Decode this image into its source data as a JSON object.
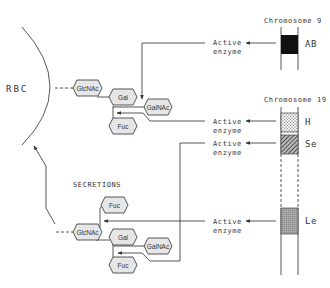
{
  "diagram": {
    "cell_label": "RBC",
    "secretions_label": "SECRETIONS",
    "chromosomes": [
      {
        "label": "Chromosome 9",
        "genes": [
          {
            "name": "AB",
            "pattern": "solid"
          }
        ]
      },
      {
        "label": "Chromosome 19",
        "genes": [
          {
            "name": "H",
            "pattern": "dotted"
          },
          {
            "name": "Se",
            "pattern": "hatched"
          },
          {
            "name": "Le",
            "pattern": "stippled"
          }
        ]
      }
    ],
    "enzymes": [
      {
        "line1": "Active",
        "line2": "enzyme"
      },
      {
        "line1": "Active",
        "line2": "enzyme"
      },
      {
        "line1": "Active",
        "line2": "enzyme"
      },
      {
        "line1": "Active",
        "line2": "enzyme"
      }
    ],
    "rbc_chain": {
      "glcnac": "GlcNAc",
      "gal": "Gal",
      "galnac": "GalNAc",
      "fuc": "Fuc"
    },
    "secretion_chain": {
      "glcnac": "GlcNAc",
      "fuc_top": "Fuc",
      "gal": "Gal",
      "galnac": "GalNAc",
      "fuc_bottom": "Fuc"
    },
    "colors": {
      "ink": "#444444",
      "hex_fill": "#e6e6e6",
      "ab_block": "#111111"
    }
  }
}
